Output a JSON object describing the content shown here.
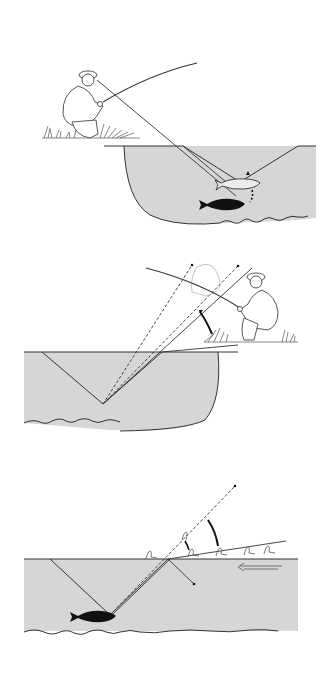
{
  "figure": {
    "colors": {
      "background": "#ffffff",
      "water": "#d6d6d6",
      "line": "#333333",
      "fish": "#111111"
    },
    "panels": [
      {
        "id": "panel-1",
        "subject": "kneeling angler on grass bank, line-of-sight into water toward trout near surface and trout in deep water",
        "elements": [
          "angler",
          "fishing-rod",
          "grass-bank",
          "water-body",
          "cone-of-vision",
          "trout-outline",
          "trout-silhouette",
          "riverbed-stones"
        ]
      },
      {
        "id": "panel-2",
        "subject": "angler kneeling on bank, refracted dashed sight lines from trout to angler, curved arrow showing raised apparent position",
        "elements": [
          "angler",
          "angler-apparent-ghost",
          "fishing-rod",
          "grass-bank",
          "water-body",
          "cone-of-vision",
          "dashed-sight-lines",
          "curved-arrow",
          "trout-silhouette",
          "riverbed-stones"
        ]
      },
      {
        "id": "panel-3",
        "subject": "flies drifting on surface, refracted view from trout, current arrow",
        "elements": [
          "drifting-flies",
          "dashed-sight-line",
          "curved-arrow",
          "reflection-arrow",
          "current-arrow",
          "water-body",
          "cone-of-vision",
          "trout-silhouette",
          "riverbed-stones"
        ]
      }
    ]
  }
}
